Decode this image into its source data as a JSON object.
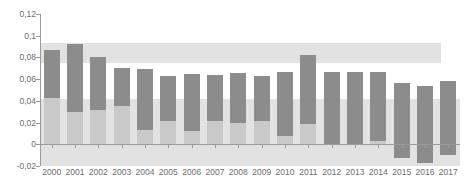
{
  "chart_data": {
    "type": "bar",
    "title": "",
    "subtitle": "",
    "xlabel": "",
    "ylabel": "",
    "grid": false,
    "legend": "none",
    "decimal_separator": ",",
    "categories": [
      "2000",
      "2001",
      "2002",
      "2003",
      "2004",
      "2005",
      "2006",
      "2007",
      "2008",
      "2009",
      "2010",
      "2011",
      "2012",
      "2013",
      "2014",
      "2015",
      "2016",
      "2017"
    ],
    "ylim": [
      -0.02,
      0.12
    ],
    "ytick_values": [
      0.12,
      0.1,
      0.08,
      0.06,
      0.04,
      0.02,
      0,
      -0.02
    ],
    "ytick_labels": [
      "0,12",
      "0,1",
      "0,08",
      "0,06",
      "0,04",
      "0,02",
      "0",
      "-0,02"
    ],
    "series": [
      {
        "name": "upper-segment",
        "color": "#8c8c8c",
        "values": [
          0.087,
          0.092,
          0.08,
          0.07,
          0.069,
          0.063,
          0.065,
          0.064,
          0.066,
          0.063,
          0.067,
          0.082,
          0.067,
          0.067,
          0.067,
          0.056,
          0.054,
          0.058
        ]
      },
      {
        "name": "lower-segment",
        "color": "#c9c9c9",
        "values": [
          0.043,
          0.03,
          0.032,
          0.035,
          0.013,
          0.021,
          0.012,
          0.021,
          0.02,
          0.021,
          0.008,
          0.019,
          0.0,
          0.0,
          0.003,
          -0.013,
          -0.017,
          -0.01
        ]
      }
    ],
    "bands": [
      {
        "name": "upper-band",
        "from": 0.075,
        "to": 0.093,
        "color": "#e2e2e2",
        "x_start_frac": 0.0,
        "x_end_frac": 0.955
      },
      {
        "name": "lower-band",
        "from": -0.02,
        "to": 0.042,
        "color": "#e2e2e2",
        "x_start_frac": 0.0,
        "x_end_frac": 1.0
      }
    ]
  }
}
